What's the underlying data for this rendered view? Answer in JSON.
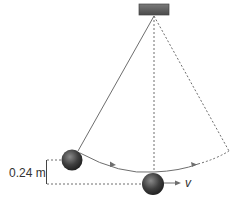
{
  "diagram": {
    "height_label": "0.24 m",
    "velocity_label": "v",
    "colors": {
      "line": "#6e6e6e",
      "ball_dark": "#2e2e2e",
      "ball_light": "#8a8a8a",
      "support": "#5a5a5a"
    }
  }
}
